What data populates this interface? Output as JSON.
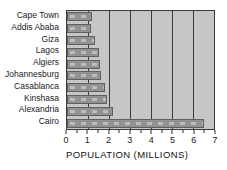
{
  "chart_data": {
    "type": "bar",
    "orientation": "horizontal",
    "title": "",
    "xlabel": "POPULATION (MILLIONS)",
    "ylabel": "",
    "categories": [
      "Cape Town",
      "Addis Ababa",
      "Giza",
      "Lagos",
      "Algiers",
      "Johannesburg",
      "Casablanca",
      "Kinshasa",
      "Alexandria",
      "Cairo"
    ],
    "values": [
      1.2,
      1.15,
      1.35,
      1.5,
      1.55,
      1.6,
      1.8,
      1.9,
      2.2,
      6.5
    ],
    "xlim": [
      0,
      7
    ],
    "x_ticks": [
      0,
      1,
      2,
      3,
      4,
      5,
      6,
      7
    ],
    "minor_tick_step": 0.5,
    "grid": true,
    "legend": "none",
    "colors": {
      "plot_bg": "#c6c6c6",
      "bar_fill": "#929292",
      "bar_border": "#5f5f5f",
      "bar_dash": "#bdbdbd",
      "grid_line": "#3a3a3a",
      "text": "#1a1a1a"
    }
  }
}
